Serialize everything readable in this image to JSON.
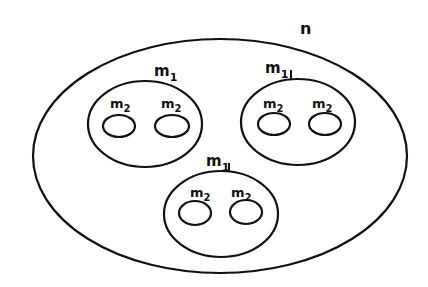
{
  "diagram": {
    "outer": {
      "label": "n"
    },
    "groups": [
      {
        "label": "m",
        "sub": "1",
        "children": [
          {
            "label": "m",
            "sub": "2"
          },
          {
            "label": "m",
            "sub": "2"
          }
        ]
      },
      {
        "label": "m",
        "sub": "1",
        "children": [
          {
            "label": "m",
            "sub": "2"
          },
          {
            "label": "m",
            "sub": "2"
          }
        ]
      },
      {
        "label": "m",
        "sub": "1",
        "children": [
          {
            "label": "m",
            "sub": "2"
          },
          {
            "label": "m",
            "sub": "2"
          }
        ]
      }
    ]
  }
}
